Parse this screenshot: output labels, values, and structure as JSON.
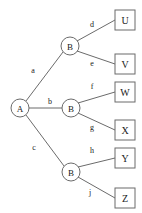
{
  "diagram": {
    "type": "tree",
    "title": "",
    "colors": {
      "stroke": "#6b6b6b",
      "text": "#1a1a1a",
      "background": "#ffffff"
    },
    "root": {
      "id": "A",
      "label": "A",
      "shape": "circle",
      "x": 20,
      "y": 108,
      "r": 9
    },
    "internal_nodes": [
      {
        "id": "B1",
        "label": "B",
        "shape": "circle",
        "x": 70,
        "y": 46,
        "r": 9
      },
      {
        "id": "B2",
        "label": "B",
        "shape": "circle",
        "x": 71,
        "y": 108,
        "r": 9
      },
      {
        "id": "B3",
        "label": "B",
        "shape": "circle",
        "x": 71,
        "y": 172,
        "r": 9
      }
    ],
    "leaf_nodes": [
      {
        "id": "U",
        "label": "U",
        "shape": "square",
        "x": 125,
        "y": 20,
        "w": 20,
        "h": 20
      },
      {
        "id": "V",
        "label": "V",
        "shape": "square",
        "x": 125,
        "y": 64,
        "w": 20,
        "h": 20
      },
      {
        "id": "W",
        "label": "W",
        "shape": "square",
        "x": 125,
        "y": 92,
        "w": 20,
        "h": 20
      },
      {
        "id": "X",
        "label": "X",
        "shape": "square",
        "x": 125,
        "y": 130,
        "w": 20,
        "h": 20
      },
      {
        "id": "Y",
        "label": "Y",
        "shape": "square",
        "x": 125,
        "y": 158,
        "w": 20,
        "h": 20
      },
      {
        "id": "Z",
        "label": "Z",
        "shape": "square",
        "x": 125,
        "y": 198,
        "w": 20,
        "h": 20
      }
    ],
    "edges": [
      {
        "id": "a",
        "label": "a",
        "from": "A",
        "to": "B1",
        "lx": 33,
        "ly": 70
      },
      {
        "id": "b",
        "label": "b",
        "from": "A",
        "to": "B2",
        "lx": 50,
        "ly": 101
      },
      {
        "id": "c",
        "label": "c",
        "from": "A",
        "to": "B3",
        "lx": 34,
        "ly": 147
      },
      {
        "id": "d",
        "label": "d",
        "from": "B1",
        "to": "U",
        "lx": 92,
        "ly": 24
      },
      {
        "id": "e",
        "label": "e",
        "from": "B1",
        "to": "V",
        "lx": 92,
        "ly": 63
      },
      {
        "id": "f",
        "label": "f",
        "from": "B2",
        "to": "W",
        "lx": 92,
        "ly": 86
      },
      {
        "id": "g",
        "label": "g",
        "from": "B2",
        "to": "X",
        "lx": 92,
        "ly": 127
      },
      {
        "id": "h",
        "label": "h",
        "from": "B3",
        "to": "Y",
        "lx": 92,
        "ly": 150
      },
      {
        "id": "j",
        "label": "j",
        "from": "B3",
        "to": "Z",
        "lx": 90,
        "ly": 192
      }
    ]
  }
}
